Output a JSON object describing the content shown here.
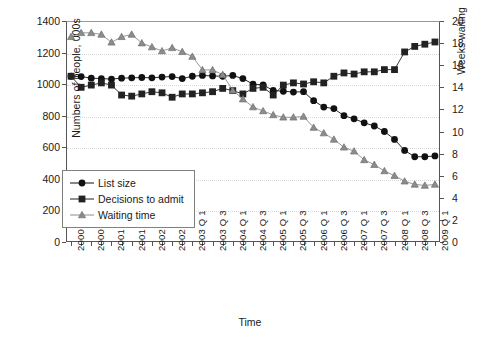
{
  "chart_data": {
    "type": "line",
    "title": "",
    "xlabel": "Time",
    "ylabel": "Numbers of people, 000s",
    "ylabel_secondary": "Weeks waiting",
    "ylim": [
      0,
      1400
    ],
    "ylim_secondary": [
      0,
      20
    ],
    "yticks": [
      0,
      200,
      400,
      600,
      800,
      1000,
      1200,
      1400
    ],
    "yticks_secondary": [
      0,
      2,
      4,
      6,
      8,
      10,
      12,
      14,
      16,
      18,
      20
    ],
    "grid": true,
    "legend_position": "lower-left",
    "categories": [
      "2000 Q1",
      "2000 Q2",
      "2000 Q3",
      "2000 Q4",
      "2001 Q1",
      "2001 Q2",
      "2001 Q3",
      "2001 Q4",
      "2002 Q1",
      "2002 Q2",
      "2002 Q3",
      "2002 Q4",
      "2003 Q1",
      "2003 Q2",
      "2003 Q3",
      "2003 Q4",
      "2004 Q1",
      "2004 Q2",
      "2004 Q3",
      "2004 Q4",
      "2005 Q1",
      "2005 Q2",
      "2005 Q3",
      "2005 Q4",
      "2006 Q1",
      "2006 Q2",
      "2006 Q3",
      "2006 Q4",
      "2007 Q1",
      "2007 Q2",
      "2007 Q3",
      "2007 Q4",
      "2008 Q1",
      "2008 Q2",
      "2008 Q3",
      "2008 Q4",
      "2009 Q1"
    ],
    "xtick_labels": [
      "2000 Q 1",
      "2000 Q 3",
      "2001 Q 1",
      "2001 Q 3",
      "2002 Q 1",
      "2002 Q 3",
      "2003 Q 1",
      "2003 Q 3",
      "2004 Q 1",
      "2004 Q 3",
      "2005 Q 1",
      "2005 Q 3",
      "2006 Q 1",
      "2006 Q 3",
      "2007 Q 1",
      "2007 Q 3",
      "2008 Q 1",
      "2008 Q 3",
      "2009 Q 1"
    ],
    "series": [
      {
        "name": "List size",
        "marker": "circle",
        "color": "#111111",
        "axis": "left",
        "values": [
          1050,
          1048,
          1038,
          1035,
          1032,
          1038,
          1040,
          1042,
          1040,
          1045,
          1048,
          1035,
          1050,
          1055,
          1052,
          1050,
          1055,
          1035,
          1000,
          995,
          960,
          955,
          950,
          952,
          895,
          855,
          845,
          800,
          780,
          755,
          735,
          700,
          650,
          580,
          540,
          540,
          545
        ]
      },
      {
        "name": "Decisions to admit",
        "marker": "square",
        "color": "#222222",
        "axis": "right",
        "values": [
          15.0,
          14.0,
          14.2,
          14.4,
          14.2,
          13.3,
          13.2,
          13.4,
          13.6,
          13.5,
          13.1,
          13.4,
          13.4,
          13.5,
          13.6,
          13.9,
          13.7,
          13.4,
          13.9,
          14.0,
          13.3,
          14.2,
          14.4,
          14.3,
          14.5,
          14.4,
          15.0,
          15.3,
          15.2,
          15.4,
          15.4,
          15.6,
          15.6,
          17.2,
          17.7,
          17.9,
          18.1
        ]
      },
      {
        "name": "Waiting time",
        "marker": "triangle",
        "color": "#8c8c8c",
        "axis": "left",
        "values": [
          1300,
          1325,
          1325,
          1315,
          1265,
          1300,
          1315,
          1260,
          1235,
          1210,
          1230,
          1205,
          1175,
          1090,
          1090,
          1060,
          960,
          905,
          855,
          830,
          805,
          790,
          790,
          795,
          725,
          690,
          650,
          600,
          575,
          520,
          490,
          450,
          420,
          385,
          365,
          358,
          365
        ]
      }
    ]
  },
  "legend": {
    "items": [
      {
        "label": "List size",
        "marker": "circle"
      },
      {
        "label": "Decisions to admit",
        "marker": "square"
      },
      {
        "label": "Waiting time",
        "marker": "triangle"
      }
    ]
  }
}
